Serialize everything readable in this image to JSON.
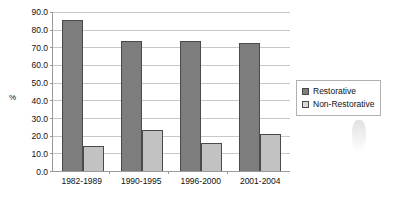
{
  "chart_data": {
    "type": "bar",
    "title": "",
    "xlabel": "",
    "ylabel": "%",
    "ylim": [
      0,
      90
    ],
    "grid": true,
    "legend_position": "right",
    "categories": [
      "1982-1989",
      "1990-1995",
      "1996-2000",
      "2001-2004"
    ],
    "y_ticks": [
      "0.0",
      "10.0",
      "20.0",
      "30.0",
      "40.0",
      "50.0",
      "60.0",
      "70.0",
      "80.0",
      "90.0"
    ],
    "y_tick_values": [
      0,
      10,
      20,
      30,
      40,
      50,
      60,
      70,
      80,
      90
    ],
    "series": [
      {
        "name": "Restorative",
        "color": "#7d7d7d",
        "values": [
          85.5,
          73.5,
          73.5,
          72.5
        ]
      },
      {
        "name": "Non-Restorative",
        "color": "#c2c2c2",
        "values": [
          14.0,
          23.0,
          16.0,
          21.0
        ]
      }
    ]
  },
  "legend": {
    "entries": [
      {
        "label": "Restorative"
      },
      {
        "label": "Non-Restorative"
      }
    ]
  },
  "colors": {
    "restorative": "#7d7d7d",
    "non_restorative": "#c2c2c2",
    "gridline": "#c8c8c8",
    "axis": "#9a9a9a"
  }
}
